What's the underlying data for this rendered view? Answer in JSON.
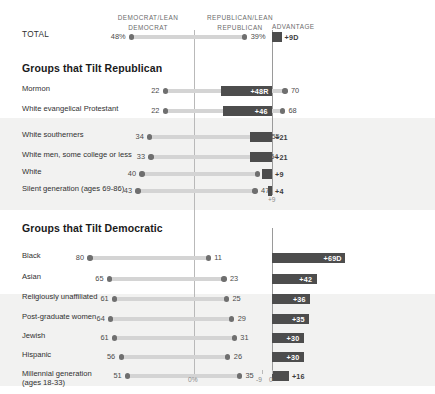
{
  "header": {
    "col_dem": "DEMOCRAT/LEAN DEMOCRAT",
    "col_rep": "REPUBLICAN/LEAN REPUBLICAN",
    "col_adv": "ADVANTAGE"
  },
  "sections": {
    "republican_title": "Groups that Tilt Republican",
    "democratic_title": "Groups that Tilt Democratic"
  },
  "axis": {
    "zero_pct": "0%",
    "adv_tick_neg9": "-9",
    "adv_tick_zero": "0",
    "rep_axis_tick": "+9"
  },
  "colors": {
    "track": "#d4d4d4",
    "dot": "#6f6f6f",
    "bar": "#4d4d4d",
    "band": "#f2f2f1",
    "axis": "#b9b9b9"
  },
  "chart_data": {
    "type": "bar",
    "xlabel": "",
    "ylabel": "",
    "legend": [
      "Democrat/Lean Democrat",
      "Republican/Lean Republican",
      "Advantage"
    ],
    "categories": [
      "TOTAL",
      "Mormon",
      "White evangelical Protestant",
      "White southerners",
      "White men, some college or less",
      "White",
      "Silent generation (ages 69-86)",
      "Black",
      "Asian",
      "Religiously unaffiliated",
      "Post-graduate women",
      "Jewish",
      "Hispanic",
      "Millennial generation (ages 18-33)"
    ],
    "series": [
      {
        "name": "Democrat/Lean Democrat",
        "values": [
          48,
          22,
          22,
          34,
          33,
          40,
          43,
          80,
          65,
          61,
          64,
          61,
          56,
          51
        ]
      },
      {
        "name": "Republican/Lean Republican",
        "values": [
          39,
          70,
          68,
          55,
          54,
          49,
          47,
          11,
          23,
          25,
          29,
          31,
          26,
          35
        ]
      },
      {
        "name": "Advantage",
        "values": [
          9,
          -48,
          -46,
          -21,
          -21,
          -9,
          -4,
          69,
          42,
          36,
          35,
          30,
          30,
          16
        ]
      }
    ]
  },
  "rows": [
    {
      "label": "TOTAL",
      "label2": "",
      "group": "total",
      "dem": "48%",
      "rep": "39%",
      "dem_val": 48,
      "rep_val": 39,
      "adv": "+9D",
      "adv_val": 9,
      "adv_side": "dem",
      "adv_inside": false
    },
    {
      "label": "Mormon",
      "label2": "",
      "group": "rep",
      "dem": "22",
      "rep": "70",
      "dem_val": 22,
      "rep_val": 70,
      "adv": "+48R",
      "adv_val": 48,
      "adv_side": "rep",
      "adv_inside": true
    },
    {
      "label": "White evangelical Protestant",
      "label2": "",
      "group": "rep",
      "dem": "22",
      "rep": "68",
      "dem_val": 22,
      "rep_val": 68,
      "adv": "+46",
      "adv_val": 46,
      "adv_side": "rep",
      "adv_inside": true
    },
    {
      "label": "White southerners",
      "label2": "",
      "group": "rep",
      "dem": "34",
      "rep": "55",
      "dem_val": 34,
      "rep_val": 55,
      "adv": "+21",
      "adv_val": 21,
      "adv_side": "rep",
      "adv_inside": false
    },
    {
      "label": "White men, some college or less",
      "label2": "",
      "group": "rep",
      "dem": "33",
      "rep": "54",
      "dem_val": 33,
      "rep_val": 54,
      "adv": "+21",
      "adv_val": 21,
      "adv_side": "rep",
      "adv_inside": false
    },
    {
      "label": "White",
      "label2": "",
      "group": "rep",
      "dem": "40",
      "rep": "49",
      "dem_val": 40,
      "rep_val": 49,
      "adv": "+9",
      "adv_val": 9,
      "adv_side": "rep",
      "adv_inside": false
    },
    {
      "label": "Silent generation (ages 69-86)",
      "label2": "",
      "group": "rep",
      "dem": "43",
      "rep": "47",
      "dem_val": 43,
      "rep_val": 47,
      "adv": "+4",
      "adv_val": 4,
      "adv_side": "rep",
      "adv_inside": false
    },
    {
      "label": "Black",
      "label2": "",
      "group": "dem",
      "dem": "80",
      "rep": "11",
      "dem_val": 80,
      "rep_val": 11,
      "adv": "+69D",
      "adv_val": 69,
      "adv_side": "dem",
      "adv_inside": true
    },
    {
      "label": "Asian",
      "label2": "",
      "group": "dem",
      "dem": "65",
      "rep": "23",
      "dem_val": 65,
      "rep_val": 23,
      "adv": "+42",
      "adv_val": 42,
      "adv_side": "dem",
      "adv_inside": true
    },
    {
      "label": "Religiously unaffiliated",
      "label2": "",
      "group": "dem",
      "dem": "61",
      "rep": "25",
      "dem_val": 61,
      "rep_val": 25,
      "adv": "+36",
      "adv_val": 36,
      "adv_side": "dem",
      "adv_inside": true
    },
    {
      "label": "Post-graduate women",
      "label2": "",
      "group": "dem",
      "dem": "64",
      "rep": "29",
      "dem_val": 64,
      "rep_val": 29,
      "adv": "+35",
      "adv_val": 35,
      "adv_side": "dem",
      "adv_inside": true
    },
    {
      "label": "Jewish",
      "label2": "",
      "group": "dem",
      "dem": "61",
      "rep": "31",
      "dem_val": 61,
      "rep_val": 31,
      "adv": "+30",
      "adv_val": 30,
      "adv_side": "dem",
      "adv_inside": true
    },
    {
      "label": "Hispanic",
      "label2": "",
      "group": "dem",
      "dem": "56",
      "rep": "26",
      "dem_val": 56,
      "rep_val": 26,
      "adv": "+30",
      "adv_val": 30,
      "adv_side": "dem",
      "adv_inside": true
    },
    {
      "label": "Millennial generation",
      "label2": "(ages 18-33)",
      "group": "dem",
      "dem": "51",
      "rep": "35",
      "dem_val": 51,
      "rep_val": 35,
      "adv": "+16",
      "adv_val": 16,
      "adv_side": "dem",
      "adv_inside": false
    }
  ]
}
